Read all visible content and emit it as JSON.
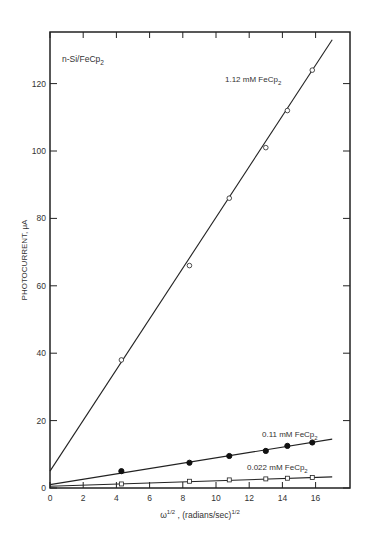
{
  "chart_data": {
    "type": "scatter",
    "title": "",
    "annotation": "n-Si/FeCp2",
    "xlabel": "ω^1/2 , (radians/sec)^1/2",
    "ylabel": "PHOTOCURRENT, μA",
    "xlim": [
      0,
      18
    ],
    "ylim": [
      0,
      136
    ],
    "xticks": [
      0,
      2,
      4,
      6,
      8,
      10,
      12,
      14,
      16
    ],
    "yticks": [
      0,
      20,
      40,
      60,
      80,
      100,
      120
    ],
    "grid": false,
    "legend_position": "inline labels",
    "series": [
      {
        "name": "1.12 mM FeCp2",
        "marker": "open-circle",
        "x": [
          4.3,
          8.4,
          10.8,
          13.0,
          14.3,
          15.8
        ],
        "y": [
          38,
          66,
          86,
          101,
          112,
          124
        ],
        "fit_line": {
          "x": [
            0,
            17
          ],
          "y": [
            5,
            133
          ]
        }
      },
      {
        "name": "0.11 mM FeCp2",
        "marker": "filled-circle",
        "x": [
          4.3,
          8.4,
          10.8,
          13.0,
          14.3,
          15.8
        ],
        "y": [
          5,
          7.5,
          9.5,
          11,
          12.5,
          13.5
        ],
        "fit_line": {
          "x": [
            0,
            17
          ],
          "y": [
            1,
            14.5
          ]
        }
      },
      {
        "name": "0.022 mM FeCp2",
        "marker": "open-square",
        "x": [
          4.3,
          8.4,
          10.8,
          13.0,
          14.3,
          15.8
        ],
        "y": [
          1.2,
          2.0,
          2.4,
          2.7,
          2.9,
          3.1
        ],
        "fit_line": {
          "x": [
            0,
            17
          ],
          "y": [
            0.5,
            3.3
          ]
        }
      }
    ]
  },
  "labels": {
    "annotation_main": "n-Si/FeCp",
    "annotation_sub": "2",
    "series0_main": "1.12 mM FeCp",
    "series0_sub": "2",
    "series1_main": "0.11 mM FeCp",
    "series1_sub": "2",
    "series2_main": "0.022 mM FeCp",
    "series2_sub": "2",
    "ylabel": "PHOTOCURRENT, μA",
    "xlabel_omega": "ω",
    "xlabel_sup1": "1/2",
    "xlabel_mid": " , (radians/sec)",
    "xlabel_sup2": "1/2"
  }
}
